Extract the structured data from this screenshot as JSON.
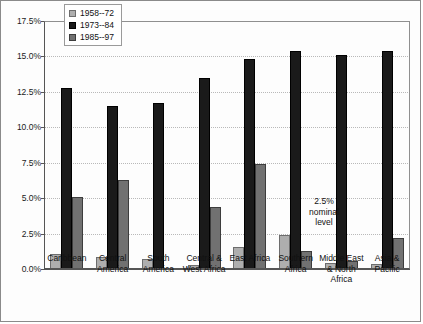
{
  "chart_data": {
    "type": "bar",
    "title": "",
    "xlabel": "",
    "ylabel": "",
    "ylim": [
      0,
      17.5
    ],
    "ytick_labels": [
      "0.0%",
      "2.5%",
      "5.0%",
      "7.5%",
      "10.0%",
      "12.5%",
      "15.0%",
      "17.5%"
    ],
    "ytick_values": [
      0,
      2.5,
      5.0,
      7.5,
      10.0,
      12.5,
      15.0,
      17.5
    ],
    "grid": true,
    "legend_position": "top-left-inside",
    "categories": [
      "Caribbean",
      "Central America",
      "South America",
      "Central & West Africa",
      "East Africa",
      "Southern Africa",
      "Middle East & North Africa",
      "Asia & Pacific"
    ],
    "category_lines": [
      [
        "Caribbean"
      ],
      [
        "Central",
        "America"
      ],
      [
        "South",
        "America"
      ],
      [
        "Central &",
        "West Africa"
      ],
      [
        "East Africa"
      ],
      [
        "Southern",
        "Africa"
      ],
      [
        "Middle East",
        "& North",
        "Africa"
      ],
      [
        "Asia &",
        "Pacific"
      ]
    ],
    "series": [
      {
        "name": "1958--72",
        "color": "#aeaeae",
        "values": [
          1.05,
          0.85,
          0.7,
          0.3,
          1.55,
          2.4,
          0.45,
          0.35
        ]
      },
      {
        "name": "1973--84",
        "color": "#1a1a1a",
        "values": [
          12.8,
          11.5,
          11.7,
          13.5,
          14.8,
          15.4,
          15.1,
          15.35
        ]
      },
      {
        "name": "1985--97",
        "color": "#717171",
        "values": [
          5.1,
          6.25,
          null,
          4.35,
          7.4,
          1.25,
          0.55,
          2.2
        ]
      }
    ],
    "annotations": [
      {
        "name": "nominal-level-note",
        "lines": [
          "2.5%",
          "nominal",
          "level"
        ]
      }
    ]
  }
}
